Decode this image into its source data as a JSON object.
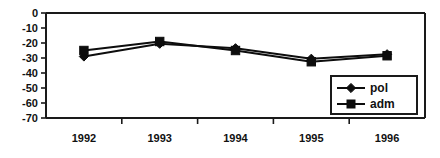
{
  "chart_data": {
    "type": "line",
    "title": "",
    "subtitle": "",
    "xlabel": "",
    "ylabel": "",
    "categories": [
      "1992",
      "1993",
      "1994",
      "1995",
      "1996"
    ],
    "series": [
      {
        "name": "pol",
        "marker": "diamond",
        "color": "#0d0d0d",
        "values": [
          -29,
          -20.5,
          -23.5,
          -30.5,
          -27.5
        ]
      },
      {
        "name": "adm",
        "marker": "square",
        "color": "#0d0d0d",
        "values": [
          -25,
          -19,
          -25,
          -32.5,
          -28.5
        ]
      }
    ],
    "ylim": [
      -70,
      0
    ],
    "yticks": [
      0,
      -10,
      -20,
      -30,
      -40,
      -50,
      -60,
      -70
    ],
    "ytick_labels": [
      "0",
      "-10",
      "-20",
      "-30",
      "-40",
      "-50",
      "-60",
      "-70"
    ],
    "grid": false,
    "legend": {
      "position": "bottom-right-inside",
      "entries": [
        "pol",
        "adm"
      ],
      "bordered": true
    },
    "frame": {
      "left_spine": true,
      "top_spine": true,
      "bottom_spine": true,
      "right_spine": true,
      "background": "#ffffff",
      "line_color": "#1a1a1a"
    }
  }
}
